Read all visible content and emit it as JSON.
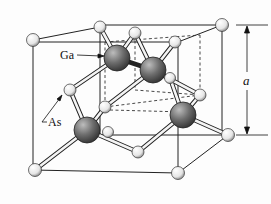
{
  "figure": {
    "labels": {
      "ga": "Ga",
      "as": "As",
      "lattice_constant": "a"
    },
    "colors": {
      "ga_atom": "#6e6e6e",
      "as_atom": "#ececec",
      "lines": "#222222",
      "background": "#fdfdfd"
    },
    "atoms": {
      "ga": [
        [
          117,
          58
        ],
        [
          153,
          70
        ],
        [
          87,
          130
        ],
        [
          183,
          115
        ]
      ],
      "as": [
        [
          33,
          40
        ],
        [
          100,
          27
        ],
        [
          135,
          33
        ],
        [
          222,
          25
        ],
        [
          175,
          42
        ],
        [
          70,
          90
        ],
        [
          105,
          107
        ],
        [
          200,
          95
        ],
        [
          228,
          135
        ],
        [
          138,
          152
        ],
        [
          35,
          170
        ],
        [
          178,
          173
        ],
        [
          108,
          132
        ],
        [
          170,
          78
        ]
      ]
    }
  }
}
